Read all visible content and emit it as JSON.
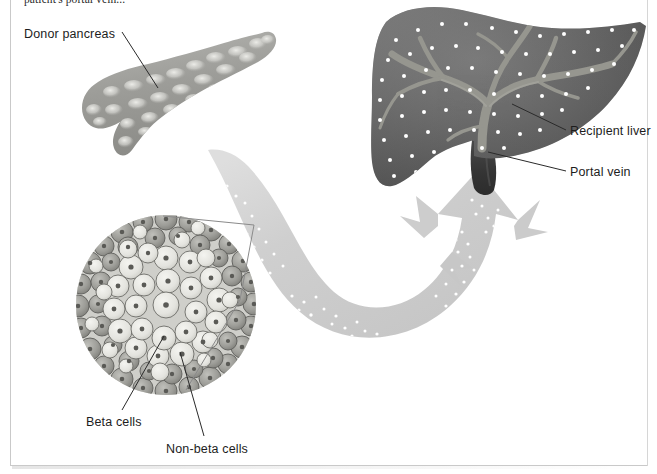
{
  "figure": {
    "clipped_caption": "patient's portal vein..."
  },
  "labels": {
    "donor_pancreas": "Donor pancreas",
    "recipient_liver": "Recipient liver",
    "portal_vein": "Portal vein",
    "beta_cells": "Beta cells",
    "non_beta_cells": "Non-beta cells"
  },
  "structures": {
    "pancreas": "donor-pancreas-organ",
    "liver": "recipient-liver-organ",
    "portal_vein": "portal-vein-stub",
    "islet": "islet-of-langerhans-magnified",
    "flow_arrow": "islet-infusion-flow-arrow",
    "callout": "magnification-callout-lines"
  },
  "colors": {
    "liver_dark": "#5d5d5d",
    "liver_mid": "#6f6f6f",
    "liver_light": "#8d8d8d",
    "vein_highlight": "#9a9a9a",
    "portal_vein": "#3a3a3a",
    "pancreas_body": "#9b9b97",
    "pancreas_lobule": "#d8d8d4",
    "arrow_gray": "#cfcfcf",
    "arrow_gray_light": "#dcdcdc",
    "islet_dot": "#ffffff",
    "beta_cell": "#e9e9e4",
    "non_beta_cell": "#9d9d99",
    "cell_outline": "#6c6c68",
    "nucleus": "#5a5a56",
    "leader_line": "#2a2a2a",
    "callout_line": "#8a8a8a",
    "frame": "#c9c9c9",
    "text": "#1d1d1d",
    "page_bg": "#ffffff"
  }
}
